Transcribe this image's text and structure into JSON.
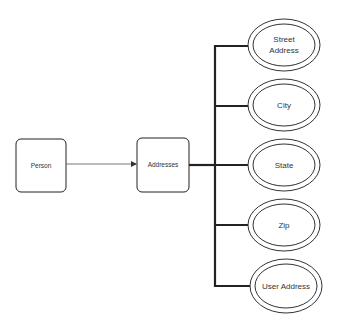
{
  "diagram": {
    "type": "entity-relationship",
    "colors": {
      "stroke": "#222222",
      "text": "#333333",
      "background": "#ffffff"
    },
    "entities": [
      {
        "id": "person",
        "label": "Person",
        "x": 16,
        "y": 139,
        "w": 50,
        "h": 53
      },
      {
        "id": "addresses",
        "label": "Addresses",
        "x": 137,
        "y": 138,
        "w": 52,
        "h": 54
      }
    ],
    "attributes": [
      {
        "id": "street-address",
        "lines": [
          "Street",
          "Address"
        ],
        "cx": 284,
        "cy": 45,
        "rx": 36,
        "ry": 26
      },
      {
        "id": "city",
        "lines": [
          "City"
        ],
        "cx": 284,
        "cy": 105,
        "rx": 36,
        "ry": 26
      },
      {
        "id": "state",
        "lines": [
          "State"
        ],
        "cx": 284,
        "cy": 165,
        "rx": 36,
        "ry": 26
      },
      {
        "id": "zip",
        "lines": [
          "Zip"
        ],
        "cx": 284,
        "cy": 225,
        "rx": 36,
        "ry": 26
      },
      {
        "id": "user-address",
        "lines": [
          "User Address"
        ],
        "cx": 286,
        "cy": 286,
        "rx": 36,
        "ry": 27
      }
    ],
    "connections": [
      {
        "from": "person",
        "to": "addresses",
        "style": "thin-arrow"
      },
      {
        "from": "addresses",
        "to": "attribute-bus",
        "style": "thick"
      }
    ]
  }
}
